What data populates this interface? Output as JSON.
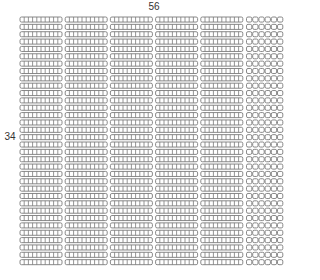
{
  "diagram": {
    "type": "base-ten-blocks-area-model",
    "top_label": "56",
    "left_label": "34",
    "rows": 34,
    "tens_per_row": 5,
    "ones_per_row": 6,
    "colors": {
      "stroke": "#7a7a7a",
      "fill": "#ffffff"
    }
  }
}
